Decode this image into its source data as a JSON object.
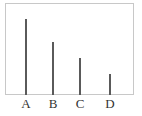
{
  "chart_data": {
    "type": "bar",
    "title": "",
    "xlabel": "",
    "ylabel": "",
    "categories": [
      "A",
      "B",
      "C",
      "D"
    ],
    "values": [
      76,
      53,
      37,
      21
    ],
    "ylim": [
      0,
      92
    ],
    "grid": false,
    "legend": null,
    "bar_color": "#5a5a5a",
    "frame_color": "#c8c8c8",
    "note": "No y-axis ticks shown; values are relative bar heights"
  },
  "layout": {
    "baseline_y": 95,
    "plot_top_y": 3,
    "bar_x": [
      26,
      53,
      80,
      110
    ]
  }
}
